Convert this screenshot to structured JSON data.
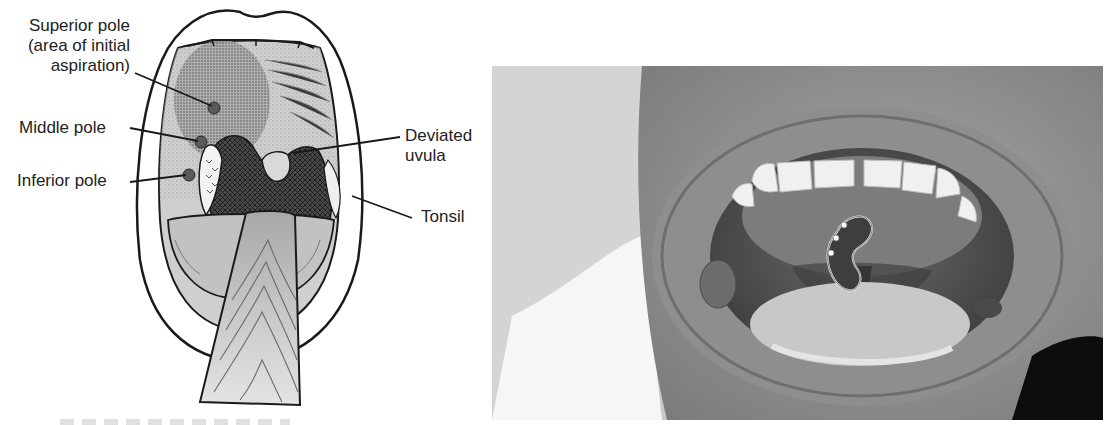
{
  "figure": {
    "drawing": {
      "labels": {
        "superior_pole": [
          "Superior pole",
          "(area of initial",
          "aspiration)"
        ],
        "middle_pole": "Middle pole",
        "inferior_pole": "Inferior pole",
        "deviated_uvula": [
          "Deviated",
          "uvula"
        ],
        "tonsil": "Tonsil"
      },
      "colors": {
        "outline": "#1a1a1a",
        "tissue": "#c9c9c9",
        "shaded_region": "#8f8f8f",
        "pharynx": "#3a3a3a",
        "tongue_depressor": "#b5b5b5",
        "pole_marker": "#555555"
      }
    },
    "photo": {
      "aspiration_points": 3,
      "outline_color": "#f0f0f0",
      "dot_color": "#ffffff"
    },
    "caption": {
      "visible": "cropped / illegible"
    }
  }
}
